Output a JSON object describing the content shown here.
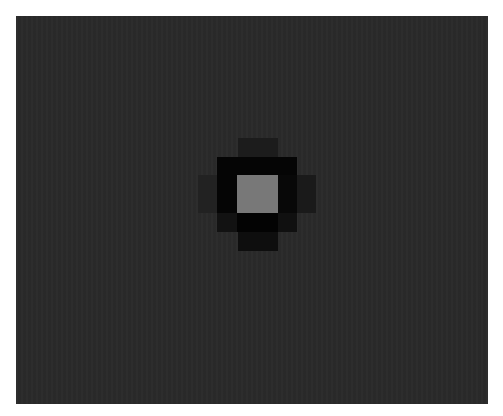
{
  "image": {
    "description": "Pixelated dark square with a central light gray pixel surrounded by black and dark pixels",
    "background_color": "#ffffff",
    "panel_color": "#2a2a2a",
    "cells": [
      {
        "name": "top-dark",
        "x": 238,
        "y": 138,
        "w": 40,
        "h": 19,
        "color": "#1c1c1c"
      },
      {
        "name": "upper-black",
        "x": 217,
        "y": 157,
        "w": 80,
        "h": 18,
        "color": "#050505"
      },
      {
        "name": "left-black",
        "x": 217,
        "y": 175,
        "w": 20,
        "h": 38,
        "color": "#050505"
      },
      {
        "name": "right-black",
        "x": 278,
        "y": 175,
        "w": 19,
        "h": 38,
        "color": "#080808"
      },
      {
        "name": "right-tab",
        "x": 297,
        "y": 175,
        "w": 19,
        "h": 38,
        "color": "#1a1a1a"
      },
      {
        "name": "left-tab",
        "x": 198,
        "y": 175,
        "w": 19,
        "h": 38,
        "color": "#222222"
      },
      {
        "name": "lower-left",
        "x": 217,
        "y": 213,
        "w": 20,
        "h": 19,
        "color": "#121212"
      },
      {
        "name": "lower-black",
        "x": 237,
        "y": 213,
        "w": 41,
        "h": 19,
        "color": "#030303"
      },
      {
        "name": "lower-right",
        "x": 278,
        "y": 213,
        "w": 19,
        "h": 19,
        "color": "#101010"
      },
      {
        "name": "bottom-dark",
        "x": 238,
        "y": 232,
        "w": 40,
        "h": 19,
        "color": "#0e0e0e"
      },
      {
        "name": "center-gray",
        "x": 237,
        "y": 175,
        "w": 41,
        "h": 38,
        "color": "#787878"
      }
    ]
  }
}
